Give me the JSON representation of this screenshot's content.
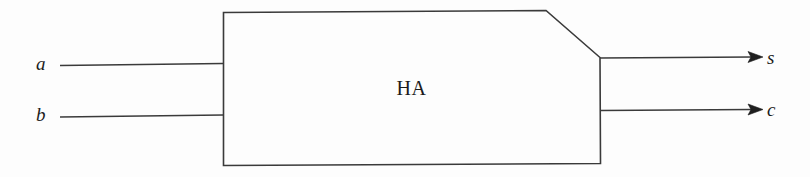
{
  "figure": {
    "background_color": "#fdfdfd",
    "stroke_color": "#3a3a3a",
    "text_color": "#1b1b1b"
  },
  "block": {
    "label": "HA",
    "shape": "rectangle-with-clipped-top-right-corner"
  },
  "inputs": [
    {
      "id": "a",
      "label": "a",
      "side": "left"
    },
    {
      "id": "b",
      "label": "b",
      "side": "left"
    }
  ],
  "outputs": [
    {
      "id": "s",
      "label": "s",
      "side": "right",
      "arrow": true
    },
    {
      "id": "c",
      "label": "c",
      "side": "right",
      "arrow": true
    }
  ]
}
